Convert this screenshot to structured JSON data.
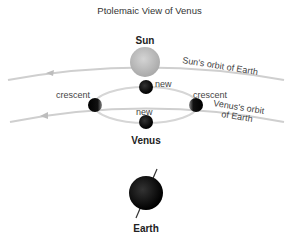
{
  "title": "Ptolemaic View of Venus",
  "labels": {
    "sun": "Sun",
    "sun_orbit": "Sun's orbit of Earth",
    "venus": "Venus",
    "venus_orbit_line1": "Venus's orbit",
    "venus_orbit_line2": "of Earth",
    "crescent_left": "crescent",
    "crescent_right": "crescent",
    "new_top": "new",
    "new_bottom": "new",
    "earth": "Earth"
  },
  "colors": {
    "orbit_line": "#c8c8c8",
    "sun": "#bdbdbd",
    "planet": "#111111",
    "epicycle": "#d8d8d8"
  }
}
